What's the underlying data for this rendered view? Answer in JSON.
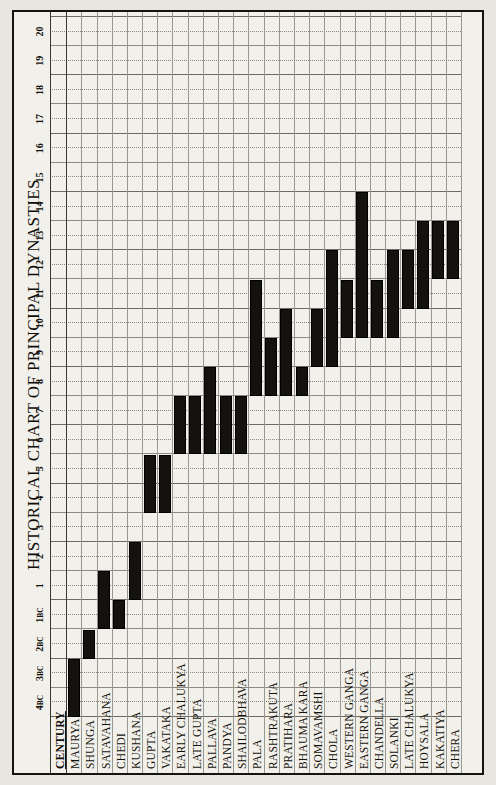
{
  "title": "HISTORICAL CHART OF PRINCIPAL DYNASTIES",
  "axis": {
    "row_header": "CENTURY",
    "century_ticks": [
      "4BC",
      "3BC",
      "2BC",
      "1BC",
      "1",
      "2",
      "3",
      "4",
      "5",
      "6",
      "7",
      "8",
      "9",
      "10",
      "11",
      "12",
      "13",
      "14",
      "15",
      "16",
      "17",
      "18",
      "19",
      "20"
    ]
  },
  "colors": {
    "bar": "#14120e",
    "paper": "#f2f0ea",
    "frame": "#15130f",
    "grid": "#8d8a83"
  },
  "chart_data": {
    "type": "bar",
    "title": "HISTORICAL CHART OF PRINCIPAL DYNASTIES",
    "xlabel": "CENTURY",
    "ylabel": "",
    "grid": true,
    "legend": "none",
    "orientation": "horizontal-range",
    "note": "Each bar is a span (start century to end century). Negative values are BC centuries: -4 = 4BC ... -1 = 1BC; 1..20 are AD centuries.",
    "xlim": [
      -4,
      20
    ],
    "categories": [
      "MAURYA",
      "SHUNGA",
      "SATAVAHANA",
      "CHEDI",
      "KUSHANA",
      "GUPTA",
      "VAKATAKA",
      "EARLY CHALUKYA",
      "LATE GUPTA",
      "PALLAVA",
      "PANDYA",
      "SHAILODBHAVA",
      "PALA",
      "RASHTRAKUTA",
      "PRATIHARA",
      "BHAUMA KARA",
      "SOMAVAMSHI",
      "CHOLA",
      "WESTERN GANGA",
      "EASTERN GANGA",
      "CHANDELLA",
      "SOLANKI",
      "LATE CHALUKYA",
      "HOYSALA",
      "KAKATIYA",
      "CHERA"
    ],
    "spans": [
      {
        "name": "MAURYA",
        "start": -4,
        "end": -2
      },
      {
        "name": "SHUNGA",
        "start": -2,
        "end": -1
      },
      {
        "name": "SATAVAHANA",
        "start": -1,
        "end": 2
      },
      {
        "name": "CHEDI",
        "start": -1,
        "end": 1
      },
      {
        "name": "KUSHANA",
        "start": 1,
        "end": 3
      },
      {
        "name": "GUPTA",
        "start": 4,
        "end": 6
      },
      {
        "name": "VAKATAKA",
        "start": 4,
        "end": 6
      },
      {
        "name": "EARLY CHALUKYA",
        "start": 6,
        "end": 8
      },
      {
        "name": "LATE GUPTA",
        "start": 6,
        "end": 8
      },
      {
        "name": "PALLAVA",
        "start": 6,
        "end": 9
      },
      {
        "name": "PANDYA",
        "start": 6,
        "end": 8
      },
      {
        "name": "SHAILODBHAVA",
        "start": 6,
        "end": 8
      },
      {
        "name": "PALA",
        "start": 8,
        "end": 12
      },
      {
        "name": "RASHTRAKUTA",
        "start": 8,
        "end": 10
      },
      {
        "name": "PRATIHARA",
        "start": 8,
        "end": 11
      },
      {
        "name": "BHAUMA KARA",
        "start": 8,
        "end": 9
      },
      {
        "name": "SOMAVAMSHI",
        "start": 9,
        "end": 11
      },
      {
        "name": "CHOLA",
        "start": 9,
        "end": 13
      },
      {
        "name": "WESTERN GANGA",
        "start": 10,
        "end": 12
      },
      {
        "name": "EASTERN GANGA",
        "start": 10,
        "end": 15
      },
      {
        "name": "CHANDELLA",
        "start": 10,
        "end": 12
      },
      {
        "name": "SOLANKI",
        "start": 10,
        "end": 13
      },
      {
        "name": "LATE CHALUKYA",
        "start": 11,
        "end": 13
      },
      {
        "name": "HOYSALA",
        "start": 11,
        "end": 14
      },
      {
        "name": "KAKATIYA",
        "start": 12,
        "end": 14
      },
      {
        "name": "CHERA",
        "start": 12,
        "end": 14
      }
    ]
  }
}
